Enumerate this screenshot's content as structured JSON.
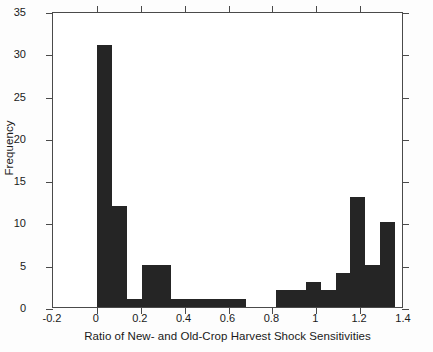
{
  "chart_data": {
    "type": "bar",
    "title": "",
    "xlabel": "Ratio of New- and Old-Crop Harvest Shock Sensitivities",
    "ylabel": "Frequency",
    "xlim": [
      -0.2,
      1.4
    ],
    "ylim": [
      0,
      35
    ],
    "xticks": [
      -0.2,
      0,
      0.2,
      0.4,
      0.6,
      0.8,
      1,
      1.2,
      1.4
    ],
    "xtick_labels": [
      "-0.2",
      "0",
      "0.2",
      "0.4",
      "0.6",
      "0.8",
      "1",
      "1.2",
      "1.4"
    ],
    "yticks": [
      0,
      5,
      10,
      15,
      20,
      25,
      30,
      35
    ],
    "ytick_labels": [
      "0",
      "5",
      "10",
      "15",
      "20",
      "25",
      "30",
      "35"
    ],
    "grid": false,
    "legend": false,
    "bin_width": 0.068,
    "bin_edges": [
      0.0,
      0.068,
      0.136,
      0.204,
      0.272,
      0.34,
      0.408,
      0.476,
      0.544,
      0.612,
      0.68,
      0.748,
      0.816,
      0.884,
      0.952,
      1.02,
      1.088,
      1.156,
      1.224,
      1.292,
      1.36
    ],
    "bin_centers": [
      0.034,
      0.102,
      0.17,
      0.238,
      0.306,
      0.374,
      0.442,
      0.51,
      0.578,
      0.646,
      0.714,
      0.782,
      0.85,
      0.918,
      0.986,
      1.054,
      1.122,
      1.19,
      1.258,
      1.326
    ],
    "values": [
      31,
      12,
      1,
      5,
      5,
      1,
      1,
      1,
      1,
      1,
      0,
      0,
      2,
      2,
      3,
      2,
      4,
      13,
      5,
      10
    ],
    "bar_color": "#252525",
    "total_count": 86
  },
  "axes": {
    "frame_color": "#4a4a4a",
    "background": "#ffffff"
  }
}
